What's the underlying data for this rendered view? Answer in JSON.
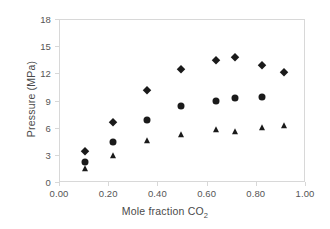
{
  "chart_data": {
    "type": "scatter",
    "title": "",
    "xlabel": "Mole fraction CO2",
    "xlabel_base": "Mole fraction CO",
    "xlabel_sub": "2",
    "ylabel": "Pressure (MPa)",
    "xlim": [
      0.0,
      1.0
    ],
    "ylim": [
      0,
      18
    ],
    "grid": false,
    "legend": "none",
    "xticks": [
      "0.00",
      "0.20",
      "0.40",
      "0.60",
      "0.80",
      "1.00"
    ],
    "xtick_values": [
      0.0,
      0.2,
      0.4,
      0.6,
      0.8,
      1.0
    ],
    "yticks": [
      "0",
      "3",
      "6",
      "9",
      "12",
      "15",
      "18"
    ],
    "ytick_values": [
      0,
      3,
      6,
      9,
      12,
      15,
      18
    ],
    "series": [
      {
        "name": "diamond-series",
        "marker": "diamond",
        "color": "#1a1a1a",
        "points": [
          {
            "x": 0.1,
            "y": 3.5
          },
          {
            "x": 0.215,
            "y": 6.7
          },
          {
            "x": 0.355,
            "y": 10.3
          },
          {
            "x": 0.49,
            "y": 12.6
          },
          {
            "x": 0.635,
            "y": 13.55
          },
          {
            "x": 0.71,
            "y": 13.9
          },
          {
            "x": 0.82,
            "y": 13.0
          },
          {
            "x": 0.91,
            "y": 12.3
          }
        ]
      },
      {
        "name": "circle-series",
        "marker": "circle",
        "color": "#1a1a1a",
        "points": [
          {
            "x": 0.1,
            "y": 2.3
          },
          {
            "x": 0.215,
            "y": 4.55
          },
          {
            "x": 0.355,
            "y": 7.0
          },
          {
            "x": 0.49,
            "y": 8.5
          },
          {
            "x": 0.635,
            "y": 9.1
          },
          {
            "x": 0.71,
            "y": 9.4
          },
          {
            "x": 0.82,
            "y": 9.55
          }
        ]
      },
      {
        "name": "triangle-series",
        "marker": "triangle",
        "color": "#1a1a1a",
        "points": [
          {
            "x": 0.1,
            "y": 1.6
          },
          {
            "x": 0.215,
            "y": 3.0
          },
          {
            "x": 0.355,
            "y": 4.65
          },
          {
            "x": 0.49,
            "y": 5.35
          },
          {
            "x": 0.635,
            "y": 5.85
          },
          {
            "x": 0.71,
            "y": 5.6
          },
          {
            "x": 0.82,
            "y": 6.1
          },
          {
            "x": 0.91,
            "y": 6.25
          }
        ]
      }
    ]
  }
}
